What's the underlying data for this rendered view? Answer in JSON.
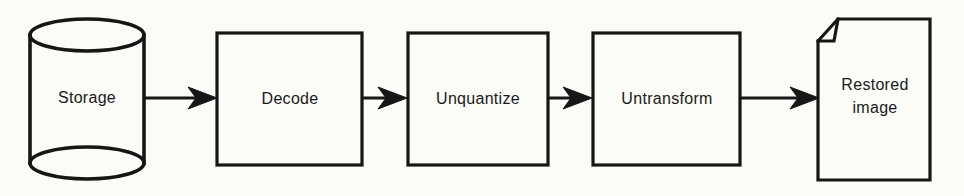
{
  "diagram": {
    "colors": {
      "stroke": "#161616",
      "background": "#fbfbf8",
      "text": "#1a1a1a"
    },
    "nodes": [
      {
        "id": "storage",
        "shape": "cylinder",
        "label": "Storage"
      },
      {
        "id": "decode",
        "shape": "rectangle",
        "label": "Decode"
      },
      {
        "id": "unquantize",
        "shape": "rectangle",
        "label": "Unquantize"
      },
      {
        "id": "untransform",
        "shape": "rectangle",
        "label": "Untransform"
      },
      {
        "id": "restored-image",
        "shape": "document",
        "label": "Restored image"
      }
    ],
    "connections": [
      {
        "from": "storage",
        "to": "decode"
      },
      {
        "from": "decode",
        "to": "unquantize"
      },
      {
        "from": "unquantize",
        "to": "untransform"
      },
      {
        "from": "untransform",
        "to": "restored-image"
      }
    ]
  }
}
